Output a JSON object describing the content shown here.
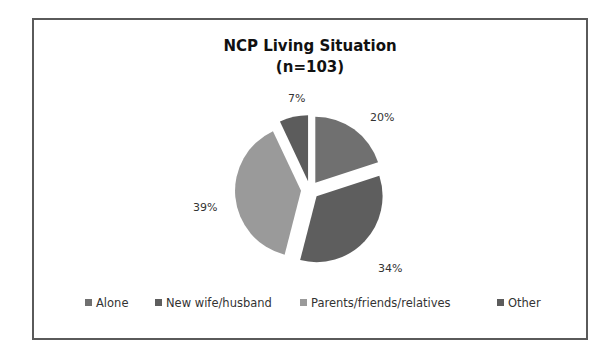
{
  "chart_data": {
    "type": "pie",
    "title": "NCP Living Situation",
    "subtitle": "(n=103)",
    "categories": [
      "Alone",
      "New wife/husband",
      "Parents/friends/relatives",
      "Other"
    ],
    "values": [
      20,
      34,
      39,
      7
    ],
    "value_labels": [
      "20%",
      "34%",
      "39%",
      "7%"
    ],
    "colors": [
      "#707070",
      "#5e5e5e",
      "#9a9a9a",
      "#5c5c5c"
    ],
    "exploded": true,
    "legend_position": "bottom"
  },
  "labels": {
    "alone": "20%",
    "new": "34%",
    "parents": "39%",
    "other": "7%"
  }
}
